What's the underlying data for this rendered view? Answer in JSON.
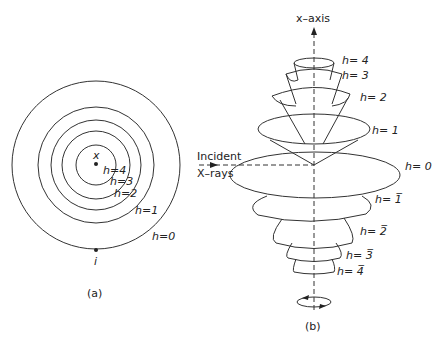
{
  "panel_a": {
    "caption": "(a)",
    "center_label": "x",
    "point_label": "i",
    "circles": [
      {
        "label": "h=0",
        "r": 84
      },
      {
        "label": "h=1",
        "r": 58
      },
      {
        "label": "h=2",
        "r": 45
      },
      {
        "label": "h=3",
        "r": 35
      },
      {
        "label": "h=4",
        "r": 21
      }
    ]
  },
  "panel_b": {
    "caption": "(b)",
    "axis_label": "x–axis",
    "incident_label_1": "Incident",
    "incident_label_2": "X–rays",
    "levels": [
      {
        "label": "h= 4"
      },
      {
        "label": "h= 3"
      },
      {
        "label": "h= 2"
      },
      {
        "label": "h= 1"
      },
      {
        "label": "h= 0"
      },
      {
        "label": "h= 1̅"
      },
      {
        "label": "h= 2̅"
      },
      {
        "label": "h= 3̅"
      },
      {
        "label": "h= 4̅"
      }
    ]
  },
  "colors": {
    "stroke": "#333333",
    "background": "#ffffff"
  }
}
